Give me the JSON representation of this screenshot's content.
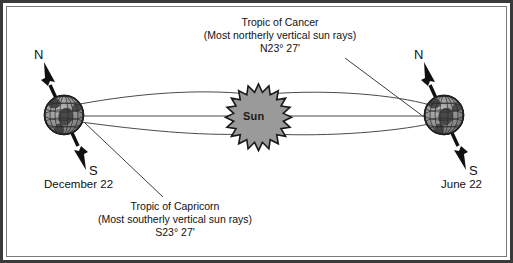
{
  "figure": {
    "title_top": {
      "line1": "Tropic of Cancer",
      "line2": "(Most northerly vertical sun rays)",
      "line3": "N23° 27'"
    },
    "title_bottom": {
      "line1": "Tropic of Capricorn",
      "line2": "(Most southerly vertical sun rays)",
      "line3": "S23° 27'"
    },
    "sun": {
      "label": "Sun"
    },
    "left_globe": {
      "date_label": "December 22",
      "north_label": "N",
      "south_label": "S"
    },
    "right_globe": {
      "date_label": "June 22",
      "north_label": "N",
      "south_label": "S"
    },
    "colors": {
      "frame": "#3a3a3a",
      "inner_rule": "#7a7a7a",
      "sun_fill": "#9a9a9a",
      "sun_outline": "#1a1a1a",
      "globe_fill": "#8d8d8d",
      "globe_outline": "#1f1f1f",
      "continent": "#4a4a4a",
      "ray_line": "#4a4a4a",
      "axis_arrow": "#111111",
      "background": "#ffffff",
      "text": "#111111"
    },
    "icons": {
      "sun": "sun-starburst-icon",
      "globe": "globe-icon",
      "axis_arrow": "axis-arrow-icon",
      "leader_line": "leader-line-icon",
      "sun_ray": "sun-ray-line-icon"
    }
  }
}
